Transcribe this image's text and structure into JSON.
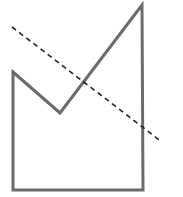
{
  "diagram": {
    "background": "#ffffff",
    "polygon": {
      "points": "13,72 60,113 142,5 143,190 13,190",
      "stroke": "#6b6b6b",
      "stroke_width": 3
    },
    "dashed_line": {
      "x1": 12,
      "y1": 27,
      "x2": 162,
      "y2": 142,
      "stroke": "#222222",
      "stroke_width": 1.6,
      "dasharray": "5,4"
    }
  }
}
